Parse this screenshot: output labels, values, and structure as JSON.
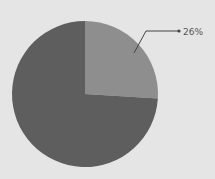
{
  "chart_data": {
    "type": "pie",
    "title": "",
    "slices": [
      {
        "label": "",
        "value": 26,
        "display": "26%",
        "color": "#8e8e8e"
      },
      {
        "label": "",
        "value": 74,
        "display": "",
        "color": "#5e5e5e"
      }
    ],
    "start_angle": "12 o'clock",
    "direction": "clockwise",
    "legend": "none",
    "annotations": [
      "26%"
    ]
  },
  "background": "#e5e5e5",
  "label_26": "26%"
}
